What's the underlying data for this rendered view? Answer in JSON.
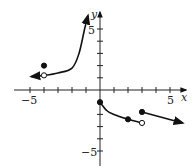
{
  "chart_data": {
    "type": "line",
    "title": "",
    "xlabel": "x",
    "ylabel": "y",
    "xlim": [
      -6,
      6
    ],
    "ylim": [
      -6,
      6
    ],
    "x_ticks": [
      -5,
      -4,
      -3,
      -2,
      -1,
      1,
      2,
      3,
      4,
      5
    ],
    "y_ticks": [
      -5,
      -4,
      -3,
      -2,
      -1,
      1,
      2,
      3,
      4,
      5
    ],
    "x_tick_labels": [
      "-5",
      "5"
    ],
    "y_tick_labels": [
      "5",
      "-5"
    ],
    "grid": false,
    "series": [
      {
        "name": "left branch (vertical asymptote near x=-1, horizontal asymptote y=1)",
        "points": [
          [
            -4.9,
            1.1
          ],
          [
            -4,
            1.2
          ],
          [
            -3,
            1.4
          ],
          [
            -2,
            1.8
          ],
          [
            -1.5,
            3.0
          ],
          [
            -1.1,
            5.0
          ],
          [
            -0.86,
            6.1
          ]
        ],
        "left_arrow": true,
        "right_arrow": true
      },
      {
        "name": "middle branch",
        "points": [
          [
            0,
            -1
          ],
          [
            0.5,
            -1.7
          ],
          [
            1,
            -2.0
          ],
          [
            2,
            -2.4
          ],
          [
            3,
            -2.7
          ]
        ],
        "left_arrow": false,
        "right_arrow": false
      },
      {
        "name": "right branch (ray)",
        "points": [
          [
            3,
            -1.8
          ],
          [
            5.9,
            -2.7
          ]
        ],
        "left_arrow": false,
        "right_arrow": true
      }
    ],
    "markers": [
      {
        "x": -4,
        "y": 2,
        "style": "filled"
      },
      {
        "x": -4,
        "y": 1.2,
        "style": "open"
      },
      {
        "x": 0,
        "y": -1,
        "style": "filled"
      },
      {
        "x": 2,
        "y": -2.4,
        "style": "filled"
      },
      {
        "x": 3,
        "y": -2.7,
        "style": "open"
      },
      {
        "x": 3,
        "y": -1.8,
        "style": "filled"
      }
    ]
  },
  "labels": {
    "x_axis": "x",
    "y_axis": "y",
    "x_neg5": "−5",
    "x_pos5": "5",
    "y_pos5": "5",
    "y_neg5": "−5"
  }
}
